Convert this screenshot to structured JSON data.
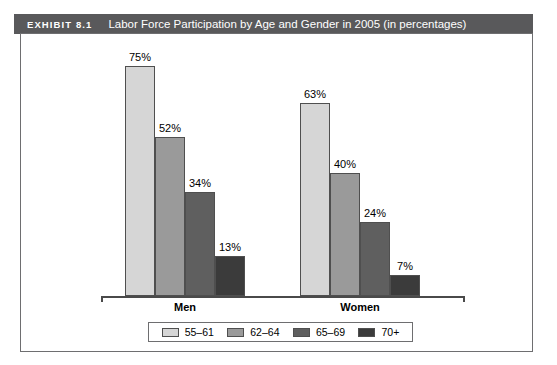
{
  "header": {
    "number": "EXHIBIT 8.1",
    "title": "Labor Force Participation by Age and Gender in 2005 (in percentages)",
    "bar_color": "#59595b",
    "text_color": "#ffffff"
  },
  "legend": {
    "position": "bottom",
    "items": [
      {
        "label": "55–61",
        "color": "#d6d6d6"
      },
      {
        "label": "62–64",
        "color": "#9a9a9a"
      },
      {
        "label": "65–69",
        "color": "#5f5f5f"
      },
      {
        "label": "70+",
        "color": "#3b3b3b"
      }
    ]
  },
  "chart_data": {
    "type": "bar",
    "title": "Labor Force Participation by Age and Gender in 2005 (in percentages)",
    "xlabel": "",
    "ylabel": "",
    "ylim": [
      0,
      80
    ],
    "grid": false,
    "legend_position": "bottom",
    "categories": [
      "Men",
      "Women"
    ],
    "series": [
      {
        "name": "55–61",
        "color": "#d6d6d6",
        "values": [
          75,
          63
        ],
        "labels": [
          "75%",
          "63%"
        ]
      },
      {
        "name": "62–64",
        "color": "#9a9a9a",
        "values": [
          52,
          40
        ],
        "labels": [
          "52%",
          "40%"
        ]
      },
      {
        "name": "65–69",
        "color": "#5f5f5f",
        "values": [
          34,
          24
        ],
        "labels": [
          "34%",
          "24%"
        ]
      },
      {
        "name": "70+",
        "color": "#3b3b3b",
        "values": [
          13,
          7
        ],
        "labels": [
          "13%",
          "7%"
        ]
      }
    ],
    "bars": [
      {
        "group": "Men",
        "series": "55–61",
        "value": 75,
        "label": "75%",
        "color": "#d6d6d6"
      },
      {
        "group": "Men",
        "series": "62–64",
        "value": 52,
        "label": "52%",
        "color": "#9a9a9a"
      },
      {
        "group": "Men",
        "series": "65–69",
        "value": 34,
        "label": "34%",
        "color": "#5f5f5f"
      },
      {
        "group": "Men",
        "series": "70+",
        "value": 13,
        "label": "13%",
        "color": "#3b3b3b"
      },
      {
        "group": "Women",
        "series": "55–61",
        "value": 63,
        "label": "63%",
        "color": "#d6d6d6"
      },
      {
        "group": "Women",
        "series": "62–64",
        "value": 40,
        "label": "40%",
        "color": "#9a9a9a"
      },
      {
        "group": "Women",
        "series": "65–69",
        "value": 24,
        "label": "24%",
        "color": "#5f5f5f"
      },
      {
        "group": "Women",
        "series": "70+",
        "value": 7,
        "label": "7%",
        "color": "#3b3b3b"
      }
    ],
    "group_labels": [
      "Men",
      "Women"
    ]
  }
}
